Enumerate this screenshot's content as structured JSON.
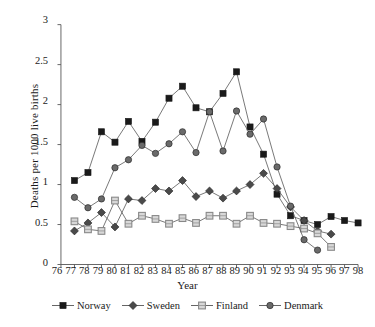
{
  "chart_data": {
    "type": "line",
    "title": "",
    "xlabel": "Year",
    "ylabel": "Deaths per 1000 live births",
    "x": [
      "76",
      "77",
      "78",
      "79",
      "80",
      "81",
      "82",
      "83",
      "84",
      "85",
      "86",
      "87",
      "88",
      "89",
      "90",
      "91",
      "92",
      "93",
      "94",
      "95",
      "96",
      "97",
      "98"
    ],
    "xlim": [
      76,
      98
    ],
    "ylim": [
      0,
      3
    ],
    "yticks": [
      "0",
      "0.5",
      "1",
      "1.5",
      "2",
      "2.5",
      "3"
    ],
    "ytick_values": [
      0,
      0.5,
      1,
      1.5,
      2,
      2.5,
      3
    ],
    "grid": false,
    "legend_position": "bottom",
    "series": [
      {
        "name": "Norway",
        "marker": "filled-square",
        "color": "#1a1a1a",
        "x": [
          "77",
          "78",
          "79",
          "80",
          "81",
          "82",
          "83",
          "84",
          "85",
          "86",
          "87",
          "88",
          "89",
          "90",
          "91",
          "92",
          "93",
          "94",
          "95",
          "96",
          "97",
          "98"
        ],
        "values": [
          1.05,
          1.15,
          1.66,
          1.53,
          1.79,
          1.54,
          1.78,
          2.08,
          2.23,
          1.96,
          1.91,
          2.14,
          2.41,
          1.72,
          1.38,
          0.88,
          0.61,
          0.55,
          0.5,
          0.6,
          0.55,
          0.52
        ]
      },
      {
        "name": "Sweden",
        "marker": "filled-diamond",
        "color": "#4a4a4a",
        "x": [
          "77",
          "78",
          "79",
          "80",
          "81",
          "82",
          "83",
          "84",
          "85",
          "86",
          "87",
          "88",
          "89",
          "90",
          "91",
          "92",
          "93",
          "94",
          "95",
          "96"
        ],
        "values": [
          0.42,
          0.52,
          0.65,
          0.47,
          0.82,
          0.8,
          0.95,
          0.92,
          1.05,
          0.85,
          0.92,
          0.83,
          0.92,
          1.0,
          1.14,
          0.95,
          0.72,
          0.55,
          0.42,
          0.38
        ]
      },
      {
        "name": "Finland",
        "marker": "open-square",
        "color": "#888888",
        "x": [
          "77",
          "78",
          "79",
          "80",
          "81",
          "82",
          "83",
          "84",
          "85",
          "86",
          "87",
          "88",
          "89",
          "90",
          "91",
          "92",
          "93",
          "94",
          "95",
          "96"
        ],
        "values": [
          0.54,
          0.44,
          0.42,
          0.8,
          0.51,
          0.61,
          0.57,
          0.51,
          0.58,
          0.52,
          0.61,
          0.61,
          0.51,
          0.61,
          0.52,
          0.51,
          0.48,
          0.45,
          0.39,
          0.22
        ]
      },
      {
        "name": "Denmark",
        "marker": "filled-circle",
        "color": "#6a6a6a",
        "x": [
          "77",
          "78",
          "79",
          "80",
          "81",
          "82",
          "83",
          "84",
          "85",
          "86",
          "87",
          "88",
          "89",
          "90",
          "91",
          "92",
          "93",
          "94",
          "95"
        ],
        "values": [
          0.84,
          0.71,
          0.82,
          1.21,
          1.31,
          1.49,
          1.39,
          1.51,
          1.66,
          1.4,
          1.91,
          1.42,
          1.92,
          1.63,
          1.82,
          1.22,
          0.73,
          0.31,
          0.18
        ]
      }
    ]
  },
  "legend": {
    "items": [
      {
        "label": "Norway"
      },
      {
        "label": "Sweden"
      },
      {
        "label": "Finland"
      },
      {
        "label": "Denmark"
      }
    ]
  }
}
